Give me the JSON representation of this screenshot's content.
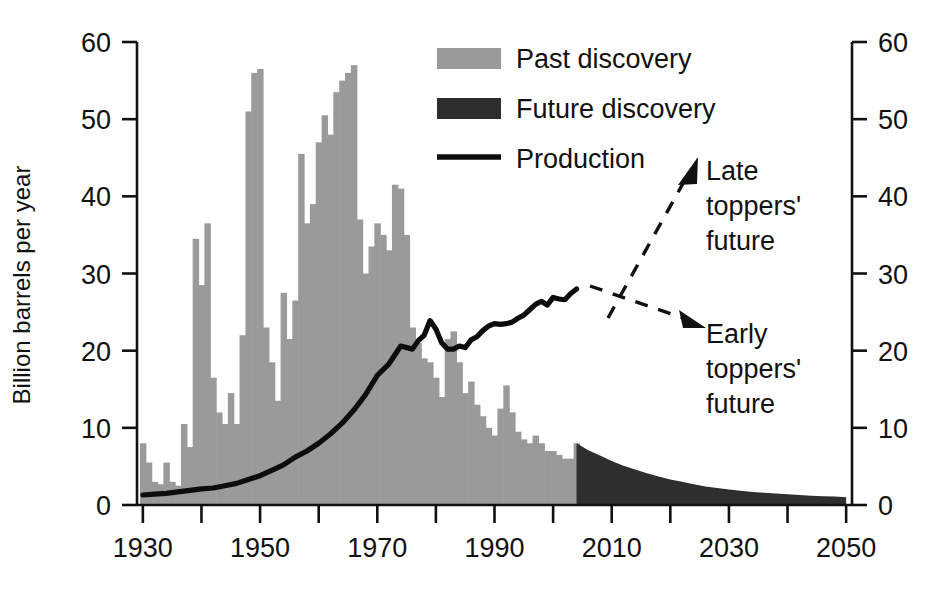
{
  "chart_data": {
    "type": "bar",
    "title": "",
    "subtitle": "",
    "xlabel": "",
    "ylabel": "Billion barrels per year",
    "ylabel_right": "",
    "xlim": [
      1929,
      2051
    ],
    "ylim": [
      0,
      60
    ],
    "grid": false,
    "legend_position": "top-center-right",
    "x_tick_labels": [
      "1930",
      "1950",
      "1970",
      "1990",
      "2010",
      "2030",
      "2050"
    ],
    "x_tick_values": [
      1930,
      1950,
      1970,
      1990,
      2010,
      2030,
      2050
    ],
    "x_minor_tick_values": [
      1940,
      1960,
      1980,
      2000,
      2020,
      2040
    ],
    "y_tick_labels": [
      "0",
      "10",
      "20",
      "30",
      "40",
      "50",
      "60"
    ],
    "y_tick_values": [
      0,
      10,
      20,
      30,
      40,
      50,
      60
    ],
    "y_tick_labels_right": [
      "0",
      "10",
      "20",
      "30",
      "40",
      "50",
      "60"
    ],
    "series": [
      {
        "name": "Past discovery",
        "type": "bar",
        "color": "#9a9a9a",
        "x": [
          1930,
          1931,
          1932,
          1933,
          1934,
          1935,
          1936,
          1937,
          1938,
          1939,
          1940,
          1941,
          1942,
          1943,
          1944,
          1945,
          1946,
          1947,
          1948,
          1949,
          1950,
          1951,
          1952,
          1953,
          1954,
          1955,
          1956,
          1957,
          1958,
          1959,
          1960,
          1961,
          1962,
          1963,
          1964,
          1965,
          1966,
          1967,
          1968,
          1969,
          1970,
          1971,
          1972,
          1973,
          1974,
          1975,
          1976,
          1977,
          1978,
          1979,
          1980,
          1981,
          1982,
          1983,
          1984,
          1985,
          1986,
          1987,
          1988,
          1989,
          1990,
          1991,
          1992,
          1993,
          1994,
          1995,
          1996,
          1997,
          1998,
          1999,
          2000,
          2001,
          2002,
          2003,
          2004
        ],
        "values": [
          8.0,
          5.5,
          3.0,
          2.7,
          5.5,
          3.0,
          2.5,
          10.5,
          7.5,
          34.5,
          28.5,
          36.5,
          16.5,
          12.0,
          10.5,
          14.5,
          10.5,
          22.0,
          51.0,
          56.0,
          56.5,
          23.0,
          18.5,
          13.5,
          27.5,
          21.5,
          26.5,
          45.5,
          36.5,
          39.0,
          47.0,
          50.5,
          48.0,
          53.5,
          55.0,
          56.0,
          57.0,
          37.0,
          30.0,
          33.5,
          36.5,
          35.0,
          33.0,
          41.5,
          41.0,
          35.0,
          23.0,
          21.0,
          19.0,
          18.5,
          16.5,
          14.0,
          21.5,
          22.5,
          18.5,
          14.5,
          16.0,
          13.0,
          11.5,
          10.0,
          9.0,
          12.5,
          15.5,
          12.0,
          9.5,
          8.5,
          8.0,
          9.0,
          8.0,
          7.0,
          7.0,
          6.5,
          6.0,
          6.0,
          8.0
        ]
      },
      {
        "name": "Future discovery",
        "type": "area",
        "color": "#2e2e2e",
        "x": [
          2004,
          2006,
          2008,
          2010,
          2012,
          2014,
          2016,
          2018,
          2020,
          2022,
          2024,
          2026,
          2028,
          2030,
          2032,
          2034,
          2036,
          2038,
          2040,
          2042,
          2044,
          2046,
          2048,
          2050
        ],
        "values": [
          8.0,
          7.1,
          6.4,
          5.7,
          5.1,
          4.6,
          4.1,
          3.7,
          3.3,
          3.0,
          2.7,
          2.4,
          2.2,
          2.0,
          1.85,
          1.7,
          1.6,
          1.5,
          1.4,
          1.3,
          1.2,
          1.15,
          1.1,
          1.0
        ]
      },
      {
        "name": "Production",
        "type": "line",
        "color": "#0d0d0d",
        "x": [
          1930,
          1932,
          1934,
          1936,
          1938,
          1940,
          1942,
          1944,
          1946,
          1948,
          1950,
          1952,
          1954,
          1956,
          1958,
          1960,
          1962,
          1964,
          1966,
          1968,
          1970,
          1972,
          1974,
          1976,
          1977,
          1978,
          1979,
          1980,
          1981,
          1982,
          1983,
          1984,
          1985,
          1986,
          1987,
          1988,
          1989,
          1990,
          1991,
          1992,
          1993,
          1994,
          1995,
          1996,
          1997,
          1998,
          1999,
          2000,
          2001,
          2002,
          2003,
          2004
        ],
        "values": [
          1.3,
          1.4,
          1.5,
          1.7,
          1.9,
          2.1,
          2.2,
          2.5,
          2.8,
          3.3,
          3.8,
          4.5,
          5.2,
          6.2,
          7.0,
          8.0,
          9.2,
          10.6,
          12.3,
          14.3,
          16.8,
          18.3,
          20.6,
          20.2,
          21.3,
          22.0,
          23.9,
          22.8,
          21.0,
          20.2,
          20.2,
          20.6,
          20.4,
          21.4,
          21.8,
          22.6,
          23.2,
          23.5,
          23.4,
          23.5,
          23.7,
          24.2,
          24.6,
          25.3,
          26.0,
          26.4,
          25.9,
          26.9,
          26.7,
          26.6,
          27.4,
          28.0
        ]
      }
    ],
    "legend": [
      {
        "label": "Past discovery",
        "marker": "swatch",
        "color": "#9a9a9a"
      },
      {
        "label": "Future discovery",
        "marker": "swatch",
        "color": "#2e2e2e"
      },
      {
        "label": "Production",
        "marker": "line",
        "color": "#0d0d0d"
      }
    ],
    "annotations": [
      {
        "id": "late-toppers",
        "lines": [
          "Late",
          "toppers'",
          "future"
        ],
        "arrow": "dashed-up-right"
      },
      {
        "id": "early-toppers",
        "lines": [
          "Early",
          "toppers'",
          "future"
        ],
        "arrow": "dashed-down-right"
      }
    ]
  },
  "colors": {
    "past_discovery": "#9a9a9a",
    "future_discovery": "#2e2e2e",
    "production": "#0d0d0d",
    "axis": "#111111",
    "background": "#ffffff"
  }
}
